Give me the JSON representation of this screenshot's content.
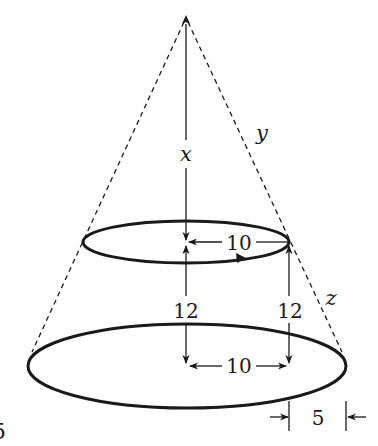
{
  "figure": {
    "labels": {
      "x": "x",
      "y": "y",
      "z": "z",
      "top_radius": "10",
      "bottom_inner_distance": "10",
      "height_left": "12",
      "height_right": "12",
      "radius_difference": "5",
      "edge_fragment": "5"
    },
    "colors": {
      "stroke": "#1a1a1a",
      "background": "#ffffff"
    }
  }
}
